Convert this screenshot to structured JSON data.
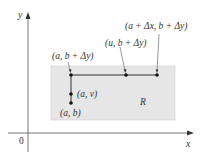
{
  "diagram": {
    "type": "region-path-diagram",
    "axes": {
      "x_label": "x",
      "y_label": "y",
      "origin_label": "0"
    },
    "region": {
      "label": "R",
      "fill_color": "#e6e6e6",
      "border_color": "#cccccc"
    },
    "points": [
      {
        "id": "a_b",
        "label": "(a, b)"
      },
      {
        "id": "a_v",
        "label": "(a, v)"
      },
      {
        "id": "a_bdy",
        "label": "(a, b + Δy)"
      },
      {
        "id": "u_bdy",
        "label": "(u, b + Δy)"
      },
      {
        "id": "adx_bdy",
        "label": "(a + Δx, b + Δy)"
      }
    ],
    "colors": {
      "axis": "#555555",
      "path": "#333333",
      "point": "#111111",
      "text": "#333333"
    }
  }
}
